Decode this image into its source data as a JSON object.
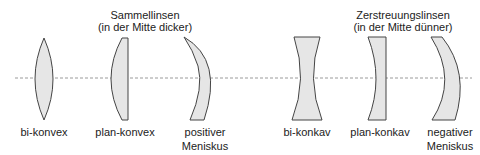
{
  "groups": {
    "converging": {
      "title": "Sammellinsen",
      "subtitle": "(in der Mitte dicker)"
    },
    "diverging": {
      "title": "Zerstreuungslinsen",
      "subtitle": "(in der Mitte dünner)"
    }
  },
  "lenses": [
    {
      "label": "bi-konvex",
      "label2": ""
    },
    {
      "label": "plan-konvex",
      "label2": ""
    },
    {
      "label": "positiver",
      "label2": "Meniskus"
    },
    {
      "label": "bi-konkav",
      "label2": ""
    },
    {
      "label": "plan-konkav",
      "label2": ""
    },
    {
      "label": "negativer",
      "label2": "Meniskus"
    }
  ],
  "colors": {
    "lens_fill": "#e6e6e6",
    "lens_stroke": "#444444",
    "axis": "#999999"
  }
}
